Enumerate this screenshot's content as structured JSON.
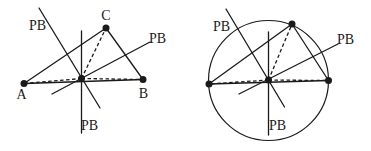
{
  "canvas": {
    "width": 371,
    "height": 151,
    "background": "#ffffff",
    "stroke_color": "#1a1a1a",
    "line_width": 1.3,
    "circle_width": 1.2,
    "dot_radius": 3.5,
    "dash_pattern": "3.5 2.5"
  },
  "figures": [
    {
      "id": "triangle-perpendicular-bisectors",
      "circles": [],
      "solid_lines": [
        {
          "name": "edge-AB",
          "x1": 24,
          "y1": 83.5,
          "x2": 143,
          "y2": 79.5
        },
        {
          "name": "edge-AC",
          "x1": 24,
          "y1": 83.5,
          "x2": 106,
          "y2": 28
        },
        {
          "name": "edge-CB",
          "x1": 106,
          "y1": 28,
          "x2": 143,
          "y2": 79.5
        },
        {
          "name": "pb-line-upper-left",
          "x1": 39,
          "y1": 8,
          "x2": 100,
          "y2": 108
        },
        {
          "name": "pb-line-right",
          "x1": 52,
          "y1": 94,
          "x2": 150,
          "y2": 42
        },
        {
          "name": "pb-line-vertical",
          "x1": 81.5,
          "y1": 31,
          "x2": 81.5,
          "y2": 133
        }
      ],
      "dashed_lines": [
        {
          "name": "segment-center-to-A",
          "x1": 81.5,
          "y1": 78.5,
          "x2": 24,
          "y2": 83.5
        },
        {
          "name": "segment-center-to-B",
          "x1": 81.5,
          "y1": 78.5,
          "x2": 143,
          "y2": 79.5
        },
        {
          "name": "segment-center-to-C",
          "x1": 81.5,
          "y1": 78.5,
          "x2": 106,
          "y2": 28
        }
      ],
      "dots": [
        {
          "name": "vertex-A-dot",
          "x": 24,
          "y": 83.5
        },
        {
          "name": "vertex-B-dot",
          "x": 143,
          "y": 79.5
        },
        {
          "name": "vertex-C-dot",
          "x": 106,
          "y": 28
        },
        {
          "name": "circumcenter-dot",
          "x": 81.5,
          "y": 78.5
        }
      ],
      "labels": [
        {
          "name": "label-pb-upper-left",
          "text": "PB",
          "x": 37.5,
          "y": 30,
          "anchor": "middle"
        },
        {
          "name": "label-pb-right",
          "text": "PB",
          "x": 157.5,
          "y": 43,
          "anchor": "middle"
        },
        {
          "name": "label-pb-bottom",
          "text": "PB",
          "x": 89.5,
          "y": 129.5,
          "anchor": "middle"
        },
        {
          "name": "label-vertex-A",
          "text": "A",
          "x": 21.5,
          "y": 99,
          "anchor": "middle"
        },
        {
          "name": "label-vertex-B",
          "text": "B",
          "x": 143.5,
          "y": 98,
          "anchor": "middle"
        },
        {
          "name": "label-vertex-C",
          "text": "C",
          "x": 106,
          "y": 19.5,
          "anchor": "middle"
        }
      ]
    },
    {
      "id": "circumscribed-circle",
      "circles": [
        {
          "name": "circumcircle",
          "cx": 268.5,
          "cy": 80.5,
          "r": 60
        }
      ],
      "solid_lines": [
        {
          "name": "edge-left-right",
          "x1": 209,
          "y1": 84,
          "x2": 328.5,
          "y2": 80.5
        },
        {
          "name": "edge-left-top",
          "x1": 209,
          "y1": 84,
          "x2": 292,
          "y2": 24
        },
        {
          "name": "edge-top-right",
          "x1": 292,
          "y1": 24,
          "x2": 328.5,
          "y2": 80.5
        },
        {
          "name": "pb-line-upper-left",
          "x1": 226,
          "y1": 9,
          "x2": 284.5,
          "y2": 107
        },
        {
          "name": "pb-line-right",
          "x1": 239,
          "y1": 94,
          "x2": 338,
          "y2": 44
        },
        {
          "name": "pb-line-vertical",
          "x1": 268.5,
          "y1": 32,
          "x2": 268.5,
          "y2": 135
        }
      ],
      "dashed_lines": [
        {
          "name": "segment-center-to-left-vertex",
          "x1": 268.5,
          "y1": 80,
          "x2": 209,
          "y2": 84
        },
        {
          "name": "segment-center-to-right-vertex",
          "x1": 268.5,
          "y1": 80,
          "x2": 328.5,
          "y2": 80.5
        },
        {
          "name": "segment-center-to-top-vertex",
          "x1": 268.5,
          "y1": 80,
          "x2": 292,
          "y2": 24
        }
      ],
      "dots": [
        {
          "name": "left-vertex-dot",
          "x": 209,
          "y": 84
        },
        {
          "name": "right-vertex-dot",
          "x": 328.5,
          "y": 80.5
        },
        {
          "name": "top-vertex-dot",
          "x": 292,
          "y": 24
        },
        {
          "name": "circumcenter-dot",
          "x": 268.5,
          "y": 80
        }
      ],
      "labels": [
        {
          "name": "label-pb-upper-left",
          "text": "PB",
          "x": 221.5,
          "y": 31,
          "anchor": "middle"
        },
        {
          "name": "label-pb-right",
          "text": "PB",
          "x": 345.5,
          "y": 43.5,
          "anchor": "middle"
        },
        {
          "name": "label-pb-bottom",
          "text": "PB",
          "x": 277.5,
          "y": 130,
          "anchor": "middle"
        }
      ]
    }
  ]
}
